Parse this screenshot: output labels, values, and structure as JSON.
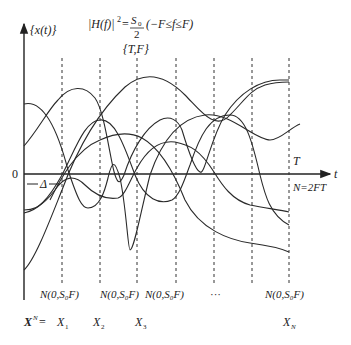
{
  "diagram": {
    "y_axis_label": "{x(t)}",
    "formula": {
      "lhs": "|H(f)|",
      "exp": "2",
      "eq": "=",
      "num": "S",
      "num_sub": "0",
      "den": "2",
      "range": "(−F≤f≤F)"
    },
    "param_label": "{T,F}",
    "origin_label": "0",
    "delta_label": "Δ",
    "x_axis_label": "t",
    "T_label": "T",
    "N_label": "N=2FT",
    "distributions": [
      "N(0,S₀F)",
      "N(0,S₀F)",
      "N(0,S₀F)",
      "···",
      "N(0,S₀F)"
    ],
    "vector_label": "X",
    "vector_sup": "N",
    "vector_eq": "=",
    "samples": [
      {
        "name": "X",
        "sub": "1"
      },
      {
        "name": "X",
        "sub": "2"
      },
      {
        "name": "X",
        "sub": "3"
      },
      {
        "name": "X",
        "sub": "N"
      }
    ],
    "sample_times_x": [
      62,
      100,
      137,
      176,
      214,
      252,
      289
    ]
  }
}
